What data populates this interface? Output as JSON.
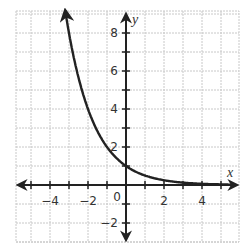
{
  "chart_data": {
    "type": "line",
    "title": "",
    "function": "y = (1/2)^x",
    "xlabel": "x",
    "ylabel": "y",
    "xlim": [
      -5.8,
      5.8
    ],
    "ylim": [
      -3.0,
      9.2
    ],
    "grid": true,
    "grid_step": 1,
    "x_ticks": [
      -4,
      -2,
      0,
      2,
      4
    ],
    "y_ticks": [
      -2,
      2,
      4,
      6,
      8
    ],
    "x_tick_labels": [
      "-4",
      "-2",
      "2",
      "4"
    ],
    "y_tick_labels": [
      "-2",
      "2",
      "4",
      "6",
      "8"
    ],
    "origin_label": "0",
    "series": [
      {
        "name": "curve",
        "x": [
          -3.2,
          -3,
          -2.5,
          -2,
          -1.5,
          -1,
          -0.5,
          0,
          0.5,
          1,
          1.5,
          2,
          2.5,
          3,
          3.5,
          4,
          4.5,
          5,
          5.6
        ],
        "y": [
          9.19,
          8,
          5.66,
          4,
          2.83,
          2,
          1.41,
          1,
          0.71,
          0.5,
          0.35,
          0.25,
          0.18,
          0.13,
          0.09,
          0.06,
          0.04,
          0.03,
          0.02
        ],
        "color": "#222222"
      }
    ],
    "legend": null
  },
  "colors": {
    "grid": "#c8c8c8",
    "axis": "#222222",
    "curve": "#222222",
    "text": "#333333"
  }
}
